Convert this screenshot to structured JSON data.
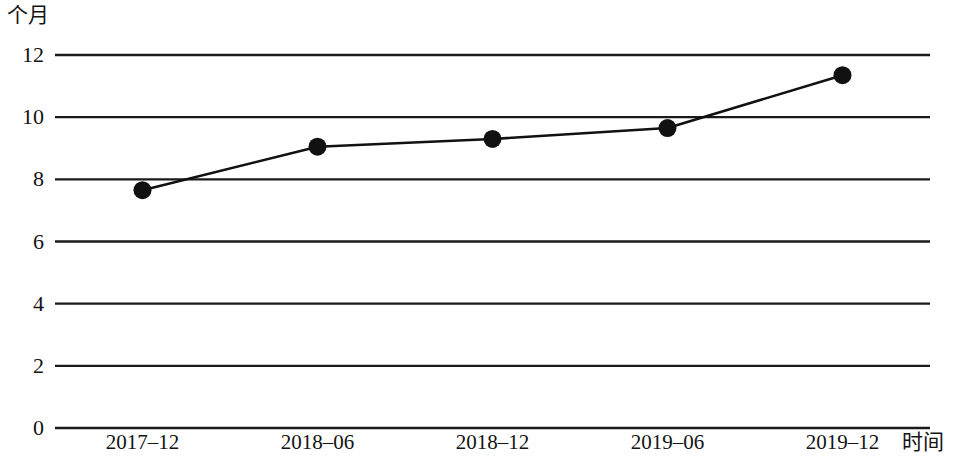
{
  "chart_data": {
    "type": "line",
    "title": "",
    "subtitle": "",
    "xlabel": "时间",
    "ylabel": "个月",
    "categories": [
      "2017–12",
      "2018–06",
      "2018–12",
      "2019–06",
      "2019–12"
    ],
    "values": [
      7.65,
      9.05,
      9.3,
      9.65,
      11.35
    ],
    "series": [
      {
        "name": "个月",
        "values": [
          7.65,
          9.05,
          9.3,
          9.65,
          11.35
        ]
      }
    ],
    "ylim": [
      0,
      12
    ],
    "ytick_labels": [
      "0",
      "2",
      "4",
      "6",
      "8",
      "10",
      "12"
    ],
    "ytick_values": [
      0,
      2,
      4,
      6,
      8,
      10,
      12
    ],
    "grid": true,
    "grid_axis": "y",
    "legend": false,
    "legend_position": "none",
    "line_color": "#111111",
    "marker_color": "#111111",
    "marker_shape": "circle",
    "grid_color": "#1a1a1a",
    "background_color": "#ffffff"
  },
  "layout": {
    "plot_left": 55,
    "plot_right": 930,
    "plot_top": 55,
    "plot_bottom": 428
  }
}
